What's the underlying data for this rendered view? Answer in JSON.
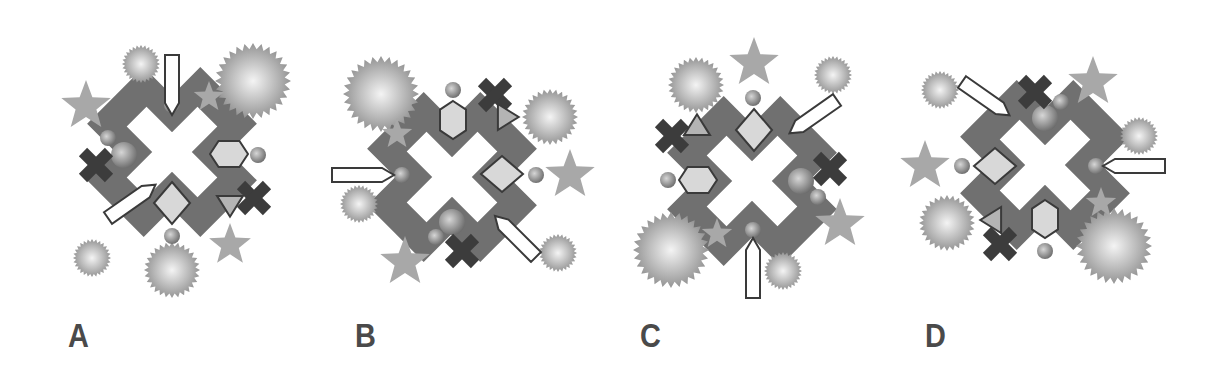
{
  "colors": {
    "cross": "#707070",
    "star": "#a8a8a8",
    "dark_x": "#3c3c3c",
    "outline": "#3a3a3a",
    "fill_light": "#d8d8d8",
    "sphere_light": "#f4f4f4",
    "sphere_dark": "#8a8a8a",
    "label": "#4a4a4a"
  },
  "panels": [
    {
      "label": "A",
      "label_x": 68,
      "cross": {
        "cx": 172,
        "cy": 152
      },
      "items": [
        {
          "t": "burst",
          "x": 141,
          "y": 64,
          "r": 19
        },
        {
          "t": "burst",
          "x": 253,
          "y": 81,
          "r": 38
        },
        {
          "t": "burst",
          "x": 92,
          "y": 258,
          "r": 19
        },
        {
          "t": "burst",
          "x": 172,
          "y": 270,
          "r": 28
        },
        {
          "t": "star",
          "x": 86,
          "y": 106,
          "r": 26
        },
        {
          "t": "star",
          "x": 209,
          "y": 97,
          "r": 16
        },
        {
          "t": "star",
          "x": 230,
          "y": 245,
          "r": 22
        },
        {
          "t": "ball",
          "x": 172,
          "y": 105,
          "r": 8
        },
        {
          "t": "ball",
          "x": 108,
          "y": 138,
          "r": 8
        },
        {
          "t": "ball",
          "x": 124,
          "y": 155,
          "r": 13
        },
        {
          "t": "ball",
          "x": 258,
          "y": 155,
          "r": 8
        },
        {
          "t": "ball",
          "x": 172,
          "y": 236,
          "r": 8
        },
        {
          "t": "xmark",
          "x": 96,
          "y": 165,
          "r": 13
        },
        {
          "t": "xmark",
          "x": 254,
          "y": 198,
          "r": 13
        },
        {
          "t": "hex",
          "x": 229,
          "y": 154,
          "w": 38,
          "h": 26
        },
        {
          "t": "diamond",
          "x": 172,
          "y": 203,
          "w": 36,
          "h": 42
        },
        {
          "t": "tri_down",
          "x": 230,
          "y": 205,
          "r": 13
        },
        {
          "t": "arrow",
          "x": 172,
          "y": 55,
          "len": 60,
          "angle": 90
        },
        {
          "t": "arrow",
          "x": 108,
          "y": 218,
          "len": 58,
          "angle": -35
        }
      ]
    },
    {
      "label": "B",
      "label_x": 355,
      "cross": {
        "cx": 452,
        "cy": 177
      },
      "items": [
        {
          "t": "burst",
          "x": 381,
          "y": 94,
          "r": 38
        },
        {
          "t": "burst",
          "x": 550,
          "y": 117,
          "r": 28
        },
        {
          "t": "burst",
          "x": 359,
          "y": 204,
          "r": 19
        },
        {
          "t": "burst",
          "x": 558,
          "y": 253,
          "r": 19
        },
        {
          "t": "star",
          "x": 397,
          "y": 134,
          "r": 16
        },
        {
          "t": "star",
          "x": 570,
          "y": 175,
          "r": 26
        },
        {
          "t": "star",
          "x": 405,
          "y": 262,
          "r": 26
        },
        {
          "t": "ball",
          "x": 453,
          "y": 90,
          "r": 8
        },
        {
          "t": "ball",
          "x": 402,
          "y": 175,
          "r": 8
        },
        {
          "t": "ball",
          "x": 536,
          "y": 175,
          "r": 8
        },
        {
          "t": "ball",
          "x": 452,
          "y": 222,
          "r": 13
        },
        {
          "t": "ball",
          "x": 436,
          "y": 237,
          "r": 8
        },
        {
          "t": "xmark",
          "x": 495,
          "y": 95,
          "r": 13
        },
        {
          "t": "xmark",
          "x": 462,
          "y": 251,
          "r": 13
        },
        {
          "t": "hex_v",
          "x": 453,
          "y": 120,
          "w": 26,
          "h": 38
        },
        {
          "t": "diamond",
          "x": 502,
          "y": 174,
          "w": 42,
          "h": 36
        },
        {
          "t": "tri_right",
          "x": 507,
          "y": 117,
          "r": 13
        },
        {
          "t": "arrow",
          "x": 332,
          "y": 175,
          "len": 62,
          "angle": 0
        },
        {
          "t": "arrow",
          "x": 536,
          "y": 257,
          "len": 58,
          "angle": -135
        }
      ]
    },
    {
      "label": "C",
      "label_x": 640,
      "cross": {
        "cx": 752,
        "cy": 181
      },
      "items": [
        {
          "t": "burst",
          "x": 696,
          "y": 85,
          "r": 28
        },
        {
          "t": "burst",
          "x": 833,
          "y": 75,
          "r": 19
        },
        {
          "t": "burst",
          "x": 671,
          "y": 250,
          "r": 38
        },
        {
          "t": "burst",
          "x": 783,
          "y": 271,
          "r": 19
        },
        {
          "t": "star",
          "x": 754,
          "y": 63,
          "r": 26
        },
        {
          "t": "star",
          "x": 840,
          "y": 224,
          "r": 26
        },
        {
          "t": "star",
          "x": 717,
          "y": 234,
          "r": 16
        },
        {
          "t": "ball",
          "x": 753,
          "y": 98,
          "r": 8
        },
        {
          "t": "ball",
          "x": 668,
          "y": 180,
          "r": 8
        },
        {
          "t": "ball",
          "x": 801,
          "y": 181,
          "r": 13
        },
        {
          "t": "ball",
          "x": 818,
          "y": 197,
          "r": 8
        },
        {
          "t": "ball",
          "x": 753,
          "y": 230,
          "r": 8
        },
        {
          "t": "xmark",
          "x": 672,
          "y": 136,
          "r": 13
        },
        {
          "t": "xmark",
          "x": 830,
          "y": 169,
          "r": 13
        },
        {
          "t": "hex",
          "x": 698,
          "y": 180,
          "w": 38,
          "h": 26
        },
        {
          "t": "diamond",
          "x": 754,
          "y": 130,
          "w": 36,
          "h": 42
        },
        {
          "t": "tri_up",
          "x": 697,
          "y": 126,
          "r": 13
        },
        {
          "t": "arrow",
          "x": 753,
          "y": 298,
          "len": 60,
          "angle": -90
        },
        {
          "t": "arrow",
          "x": 837,
          "y": 100,
          "len": 58,
          "angle": 145
        }
      ]
    },
    {
      "label": "D",
      "label_x": 925,
      "cross": {
        "cx": 1045,
        "cy": 165
      },
      "items": [
        {
          "t": "burst",
          "x": 940,
          "y": 90,
          "r": 19
        },
        {
          "t": "burst",
          "x": 1139,
          "y": 136,
          "r": 19
        },
        {
          "t": "burst",
          "x": 947,
          "y": 223,
          "r": 28
        },
        {
          "t": "burst",
          "x": 1114,
          "y": 246,
          "r": 38
        },
        {
          "t": "star",
          "x": 1093,
          "y": 82,
          "r": 26
        },
        {
          "t": "star",
          "x": 925,
          "y": 166,
          "r": 26
        },
        {
          "t": "star",
          "x": 1101,
          "y": 203,
          "r": 16
        },
        {
          "t": "ball",
          "x": 1061,
          "y": 102,
          "r": 8
        },
        {
          "t": "ball",
          "x": 1045,
          "y": 118,
          "r": 13
        },
        {
          "t": "ball",
          "x": 962,
          "y": 166,
          "r": 8
        },
        {
          "t": "ball",
          "x": 1096,
          "y": 166,
          "r": 8
        },
        {
          "t": "ball",
          "x": 1045,
          "y": 251,
          "r": 8
        },
        {
          "t": "xmark",
          "x": 1035,
          "y": 92,
          "r": 13
        },
        {
          "t": "xmark",
          "x": 1000,
          "y": 244,
          "r": 13
        },
        {
          "t": "diamond",
          "x": 995,
          "y": 166,
          "w": 42,
          "h": 36
        },
        {
          "t": "hex_v",
          "x": 1045,
          "y": 219,
          "w": 26,
          "h": 38
        },
        {
          "t": "tri_left",
          "x": 992,
          "y": 220,
          "r": 13
        },
        {
          "t": "arrow",
          "x": 1165,
          "y": 166,
          "len": 62,
          "angle": 180
        },
        {
          "t": "arrow",
          "x": 962,
          "y": 82,
          "len": 58,
          "angle": 35
        }
      ]
    }
  ]
}
